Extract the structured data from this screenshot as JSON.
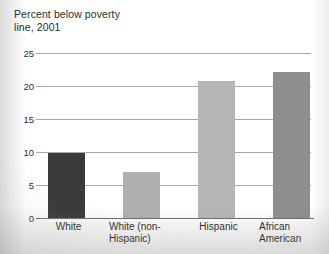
{
  "chart_data": {
    "type": "bar",
    "title": "Percent below poverty line, 2001",
    "title_line1": "Percent below poverty",
    "title_line2": "line, 2001",
    "xlabel": "",
    "ylabel": "",
    "ylim": [
      0,
      25
    ],
    "ytick_values": [
      0,
      5,
      10,
      15,
      20,
      25
    ],
    "ytick_labels": [
      "0",
      "5",
      "10",
      "15",
      "20",
      "25"
    ],
    "grid": true,
    "legend": "none",
    "categories": [
      "White",
      "White (non-Hispanic)",
      "Hispanic",
      "African American"
    ],
    "values": [
      9.9,
      7.0,
      20.8,
      22.1
    ],
    "bar_colors": [
      "#3a3a3a",
      "#b0b0b0",
      "#b5b5b5",
      "#8e8e8e"
    ],
    "bars": [
      {
        "label_line1": "White",
        "label_line2": "",
        "value": 9.9,
        "color": "#3a3a3a"
      },
      {
        "label_line1": "White (non-",
        "label_line2": "Hispanic)",
        "value": 7.0,
        "color": "#b0b0b0"
      },
      {
        "label_line1": "Hispanic",
        "label_line2": "",
        "value": 20.8,
        "color": "#b5b5b5"
      },
      {
        "label_line1": "African",
        "label_line2": "American",
        "value": 22.1,
        "color": "#8e8e8e"
      }
    ]
  }
}
